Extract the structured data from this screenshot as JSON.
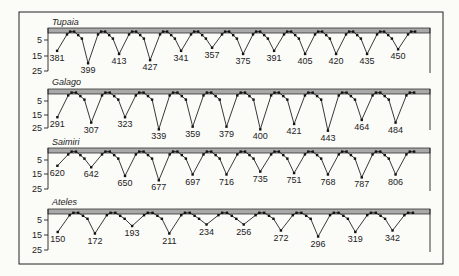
{
  "chart_data": [
    {
      "type": "line",
      "title": "Tupaia",
      "ylabel": "",
      "yticks": [
        5,
        15,
        25
      ],
      "ylim": [
        0,
        25
      ],
      "band": "shaded reference band at top (0 level)",
      "trough_labels": [
        "381",
        "399",
        "413",
        "427",
        "341",
        "357",
        "375",
        "391",
        "405",
        "420",
        "435",
        "450"
      ],
      "trough_values": [
        12,
        20,
        14,
        18,
        12,
        10,
        14,
        12,
        14,
        14,
        14,
        11
      ]
    },
    {
      "type": "line",
      "title": "Galago",
      "yticks": [
        5,
        15,
        25
      ],
      "ylim": [
        0,
        25
      ],
      "trough_labels": [
        "291",
        "307",
        "323",
        "339",
        "359",
        "379",
        "400",
        "421",
        "443",
        "464",
        "484"
      ],
      "trough_values": [
        17,
        21,
        17,
        26,
        24,
        24,
        26,
        22,
        27,
        19,
        21
      ]
    },
    {
      "type": "line",
      "title": "Saimiri",
      "yticks": [
        5,
        15,
        25
      ],
      "ylim": [
        0,
        25
      ],
      "trough_labels": [
        "620",
        "642",
        "650",
        "677",
        "697",
        "716",
        "735",
        "751",
        "768",
        "787",
        "806"
      ],
      "trough_values": [
        9,
        10,
        16,
        19,
        15,
        15,
        13,
        14,
        15,
        17,
        15
      ]
    },
    {
      "type": "line",
      "title": "Ateles",
      "yticks": [
        5,
        15,
        25
      ],
      "ylim": [
        0,
        25
      ],
      "trough_labels": [
        "150",
        "172",
        "193",
        "211",
        "234",
        "256",
        "272",
        "296",
        "319",
        "342"
      ],
      "trough_values": [
        13,
        14,
        9,
        14,
        8,
        8,
        12,
        16,
        13,
        12
      ]
    }
  ],
  "panels": [
    {
      "title": "Tupaia"
    },
    {
      "title": "Galago"
    },
    {
      "title": "Saimiri"
    },
    {
      "title": "Ateles"
    }
  ]
}
